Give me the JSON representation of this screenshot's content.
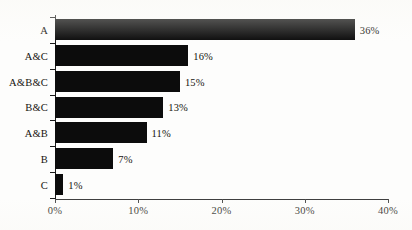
{
  "chart_data": {
    "type": "bar",
    "orientation": "horizontal",
    "title": "",
    "subtitle": "",
    "xlabel": "",
    "ylabel": "",
    "categories": [
      "A",
      "A&C",
      "A&B&C",
      "B&C",
      "A&B",
      "B",
      "C"
    ],
    "values": [
      36,
      16,
      15,
      13,
      11,
      7,
      1
    ],
    "value_labels": [
      "36%",
      "16%",
      "15%",
      "13%",
      "11%",
      "7%",
      "1%"
    ],
    "xlim": [
      0,
      40
    ],
    "xticks": [
      0,
      10,
      20,
      30,
      40
    ],
    "xtick_labels": [
      "0%",
      "10%",
      "20%",
      "30%",
      "40%"
    ],
    "grid": false,
    "legend": false,
    "legend_position": "none",
    "bar_color": "#0c0c0c",
    "axis_color": "#1a1a1a",
    "background_color": "#fdfdfc",
    "text_color": "#16140f",
    "annotations": []
  }
}
